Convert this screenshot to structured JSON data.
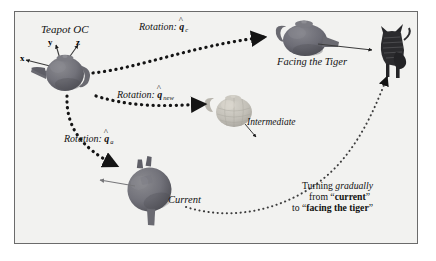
{
  "figure": {
    "background_color": "#f2f2f0",
    "border_color": "#6b6b6b",
    "page_color": "#ffffff"
  },
  "labels": {
    "teapot_oc": "Teapot OC",
    "axis_x": "x",
    "axis_y": "y",
    "axis_z": "z",
    "rotation_prefix": "Rotation:",
    "quat_symbol": "q",
    "quat_hat": "^",
    "sub_c": "c",
    "sub_new": "new",
    "sub_a": "a",
    "facing_the_tiger": "Facing the Tiger",
    "intermediate": "Intermediate",
    "current": "Current"
  },
  "annotation": {
    "line1_plain": "Turning ",
    "line1_italic": "gradually",
    "line2_plain": "from ",
    "line2_quote_open": "“",
    "line2_bold": "current",
    "line2_quote_close": "”",
    "line3_plain": "to ",
    "line3_quote_open": "“",
    "line3_bold": "facing the tiger",
    "line3_quote_close": "”"
  },
  "objects": {
    "teapot_oc_name": "teapot-origin-configuration",
    "teapot_facing_tiger_name": "teapot-facing-tiger",
    "teapot_intermediate_name": "teapot-intermediate",
    "teapot_current_name": "teapot-current",
    "tiger_name": "tiger-figure"
  },
  "colors": {
    "teapot_dark": "#6f6f74",
    "teapot_dark_shadow": "#55555b",
    "teapot_light": "#bfbcb4",
    "tiger": "#2b2b2e",
    "arrow": "#1a1a1a",
    "thin_arrow": "#6e6e6e"
  }
}
